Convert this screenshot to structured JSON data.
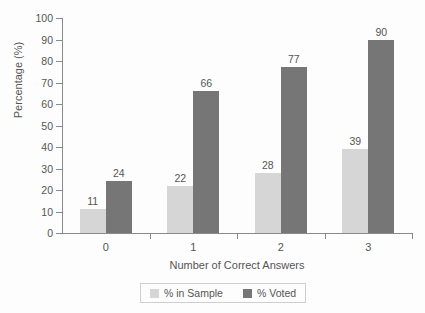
{
  "chart_data": {
    "type": "bar",
    "title": "",
    "xlabel": "Number of Correct Answers",
    "ylabel": "Percentage (%)",
    "categories": [
      "0",
      "1",
      "2",
      "3"
    ],
    "series": [
      {
        "name": "% in Sample",
        "color": "#d6d6d6",
        "values": [
          11,
          22,
          28,
          39
        ]
      },
      {
        "name": "% Voted",
        "color": "#767676",
        "values": [
          24,
          66,
          77,
          90
        ]
      }
    ],
    "ylim": [
      0,
      100
    ],
    "yticks": [
      0,
      10,
      20,
      30,
      40,
      50,
      60,
      70,
      80,
      90,
      100
    ],
    "ytick_labels": [
      "0",
      "10",
      "20",
      "30",
      "40",
      "50",
      "60",
      "70",
      "80",
      "90",
      "100"
    ],
    "grid": false,
    "legend_position": "bottom",
    "data_labels": true,
    "axis_color": "#8a8a8a",
    "text_color": "#555555",
    "background": "#fdfdfd"
  }
}
